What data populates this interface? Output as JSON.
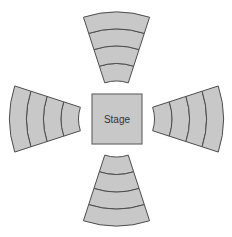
{
  "diagram": {
    "type": "radial-seating-plan",
    "stage": {
      "label": "Stage",
      "shape": "square",
      "fill_color": "#c8c8c8",
      "stroke_color": "#6b6b6b",
      "text_color": "#333333"
    },
    "geometry": {
      "center_x": 116.5,
      "center_y": 119,
      "inner_radius": 38,
      "outer_radius": 107,
      "band_radii": [
        38,
        55.5,
        73,
        90,
        107
      ],
      "band_count": 4,
      "section_count": 4,
      "gap_half_angle_deg": 17,
      "stage_x": 92,
      "stage_y": 94,
      "stage_width": 50,
      "stage_height": 50
    },
    "style": {
      "band_fill": "#c8c8c8",
      "band_stroke": "#4d4d4d",
      "background": "#ffffff"
    },
    "sections": [
      {
        "name": "north-section",
        "label": "",
        "start_angle_deg": 252,
        "end_angle_deg": 288,
        "rows": 4
      },
      {
        "name": "east-section",
        "label": "",
        "start_angle_deg": 342,
        "end_angle_deg": 18,
        "rows": 4
      },
      {
        "name": "south-section",
        "label": "",
        "start_angle_deg": 72,
        "end_angle_deg": 108,
        "rows": 4
      },
      {
        "name": "west-section",
        "label": "",
        "start_angle_deg": 162,
        "end_angle_deg": 198,
        "rows": 4
      }
    ]
  }
}
